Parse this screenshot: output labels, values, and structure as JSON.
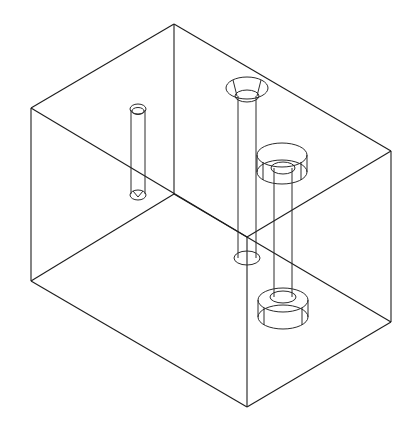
{
  "drawing": {
    "type": "isometric wireframe",
    "subject": "rectangular block with three through-holes",
    "background": "#ffffff",
    "line_color": "#1e1e1e",
    "box": {
      "vertices": {
        "top_back": [
          174,
          24
        ],
        "top_left": [
          31,
          108
        ],
        "top_right": [
          391,
          151
        ],
        "top_front": [
          247,
          237
        ],
        "bottom_back": [
          174,
          194
        ],
        "bottom_left": [
          31,
          281
        ],
        "bottom_right": [
          391,
          322
        ],
        "bottom_front": [
          247,
          407
        ]
      }
    },
    "holes": [
      {
        "name": "small-through-hole",
        "cx": 138,
        "top_y": 109,
        "bottom_y": 195,
        "r": 8
      },
      {
        "name": "countersunk-hole",
        "cx": 247,
        "top_y": 88,
        "bottom_y": 258,
        "r": 10,
        "countersink_r": 21
      },
      {
        "name": "counterbored-hole",
        "cx": 283,
        "top_y": 155,
        "bottom_y": 317,
        "r": 9,
        "counterbore_r": 25
      }
    ]
  }
}
